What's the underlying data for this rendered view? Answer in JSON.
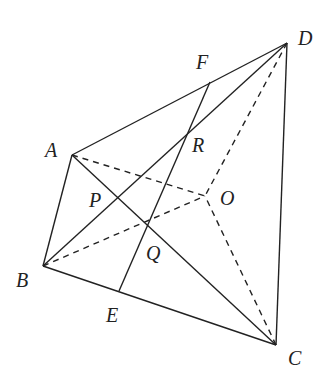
{
  "diagram": {
    "type": "geometry",
    "points": {
      "A": {
        "label": "A",
        "x": 72,
        "y": 155
      },
      "B": {
        "label": "B",
        "x": 43,
        "y": 266
      },
      "C": {
        "label": "C",
        "x": 276,
        "y": 345
      },
      "D": {
        "label": "D",
        "x": 287,
        "y": 43
      },
      "E": {
        "label": "E",
        "x": 119,
        "y": 291
      },
      "F": {
        "label": "F",
        "x": 210,
        "y": 82
      },
      "O": {
        "label": "O",
        "x": 205,
        "y": 196
      },
      "P": {
        "label": "P",
        "x": 118,
        "y": 198
      },
      "Q": {
        "label": "Q",
        "x": 148,
        "y": 223
      },
      "R": {
        "label": "R",
        "x": 188,
        "y": 132
      }
    },
    "solid_segments": [
      "AD",
      "AB",
      "BC",
      "CD",
      "AC",
      "BD",
      "EF"
    ],
    "dashed_segments": [
      "AO",
      "BO",
      "CO",
      "DO"
    ],
    "stroke_color": "#222222"
  }
}
